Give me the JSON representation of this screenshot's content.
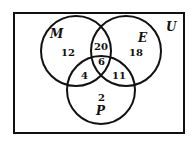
{
  "diagram": {
    "type": "venn-3-set",
    "universe_label": "U",
    "sets": [
      {
        "id": "M",
        "label": "M",
        "cx": 76,
        "cy": 51,
        "r": 35
      },
      {
        "id": "E",
        "label": "E",
        "cx": 126,
        "cy": 51,
        "r": 35
      },
      {
        "id": "P",
        "label": "P",
        "cx": 101,
        "cy": 90,
        "r": 34
      }
    ],
    "regions": {
      "M_only": "12",
      "E_only": "18",
      "M_and_E_only": "20",
      "M_E_P": "6",
      "M_and_P_only": "4",
      "E_and_P_only": "11",
      "P_only": "2"
    },
    "colors": {
      "stroke": "#111111",
      "background": "#ffffff"
    }
  }
}
